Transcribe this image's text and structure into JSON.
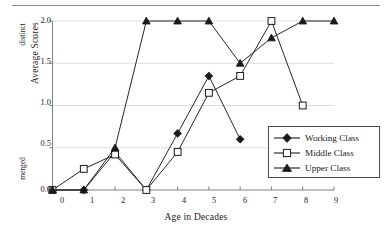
{
  "chart_data": {
    "type": "line",
    "title": "",
    "xlabel": "Age in Decades",
    "ylabel": "Average Scores",
    "x": [
      0,
      1,
      2,
      3,
      4,
      5,
      6,
      7,
      8,
      9
    ],
    "xlim": [
      0,
      9
    ],
    "ylim": [
      0.0,
      2.0
    ],
    "xticklabels": [
      "0",
      "1",
      "2",
      "3",
      "4",
      "5",
      "6",
      "7",
      "8",
      "9"
    ],
    "yticklabels": [
      "0.0",
      "0.5",
      "1.0",
      "1.5",
      "2.0"
    ],
    "ytickvalues": [
      0.0,
      0.5,
      1.0,
      1.5,
      2.0
    ],
    "y_axis_annotations": [
      {
        "value": 0.0,
        "label": "merged"
      },
      {
        "value": 2.0,
        "label": "distinct"
      }
    ],
    "grid": true,
    "grid_axis": "y",
    "legend_position": "right-lower",
    "series": [
      {
        "name": "Working Class",
        "marker": "filled-diamond",
        "color": "#1a1a1a",
        "x": [
          0,
          1,
          2,
          3,
          4,
          5,
          6
        ],
        "values": [
          0.0,
          0.0,
          0.45,
          0.0,
          0.67,
          1.35,
          0.6
        ]
      },
      {
        "name": "Middle Class",
        "marker": "open-square",
        "color": "#1a1a1a",
        "x": [
          0,
          1,
          2,
          3,
          4,
          5,
          6,
          7,
          8
        ],
        "values": [
          0.0,
          0.25,
          0.42,
          0.0,
          0.45,
          1.15,
          1.35,
          2.0,
          1.0
        ]
      },
      {
        "name": "Upper Class",
        "marker": "filled-triangle",
        "color": "#1a1a1a",
        "x": [
          0,
          1,
          2,
          3,
          4,
          5,
          6,
          7,
          8,
          9
        ],
        "values": [
          0.0,
          0.0,
          0.5,
          2.0,
          2.0,
          2.0,
          1.5,
          1.8,
          2.0,
          2.0
        ]
      }
    ]
  },
  "legend": {
    "items": [
      {
        "label": "Working Class",
        "marker": "filled-diamond"
      },
      {
        "label": "Middle Class",
        "marker": "open-square"
      },
      {
        "label": "Upper Class",
        "marker": "filled-triangle"
      }
    ]
  }
}
